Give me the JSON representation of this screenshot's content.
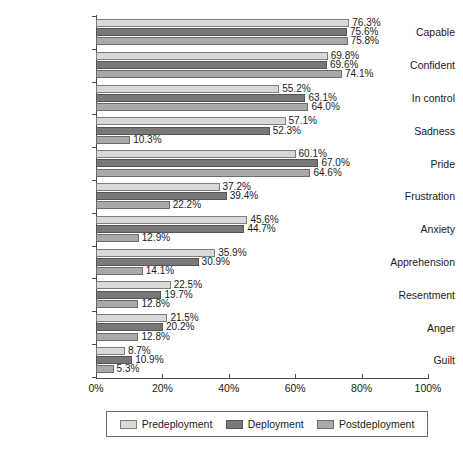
{
  "chart_data": {
    "type": "bar",
    "orientation": "horizontal",
    "title": "",
    "subtitle": "",
    "xlabel": "",
    "ylabel": "",
    "xlim": [
      0,
      100
    ],
    "xticks": [
      "0%",
      "20%",
      "40%",
      "60%",
      "80%",
      "100%"
    ],
    "xtick_values": [
      0,
      20,
      40,
      60,
      80,
      100
    ],
    "grid": false,
    "legend_position": "bottom",
    "value_label_suffix": "%",
    "categories": [
      "Capable",
      "Confident",
      "In control",
      "Sadness",
      "Pride",
      "Frustration",
      "Anxiety",
      "Apprehension",
      "Resentment",
      "Anger",
      "Guilt"
    ],
    "series": [
      {
        "name": "Predeployment",
        "color": "#d9d9d9",
        "values": [
          76.3,
          69.8,
          55.2,
          57.1,
          60.1,
          37.2,
          45.6,
          35.9,
          22.5,
          21.5,
          8.7
        ],
        "labels": [
          "76.3%",
          "69.8%",
          "55.2%",
          "57.1%",
          "60.1%",
          "37.2%",
          "45.6%",
          "35.9%",
          "22.5%",
          "21.5%",
          "8.7%"
        ]
      },
      {
        "name": "Deployment",
        "color": "#787878",
        "values": [
          75.6,
          69.6,
          63.1,
          52.3,
          67.0,
          39.4,
          44.7,
          30.9,
          19.7,
          20.2,
          10.9
        ],
        "labels": [
          "75.6%",
          "69.6%",
          "63.1%",
          "52.3%",
          "67.0%",
          "39.4%",
          "44.7%",
          "30.9%",
          "19.7%",
          "20.2%",
          "10.9%"
        ]
      },
      {
        "name": "Postdeployment",
        "color": "#a9a9a9",
        "values": [
          75.8,
          74.1,
          64.0,
          10.3,
          64.6,
          22.2,
          12.9,
          14.1,
          12.8,
          12.8,
          5.3
        ],
        "labels": [
          "75.8%",
          "74.1%",
          "64.0%",
          "10.3%",
          "64.6%",
          "22.2%",
          "12.9%",
          "14.1%",
          "12.8%",
          "12.8%",
          "5.3%"
        ]
      }
    ]
  }
}
